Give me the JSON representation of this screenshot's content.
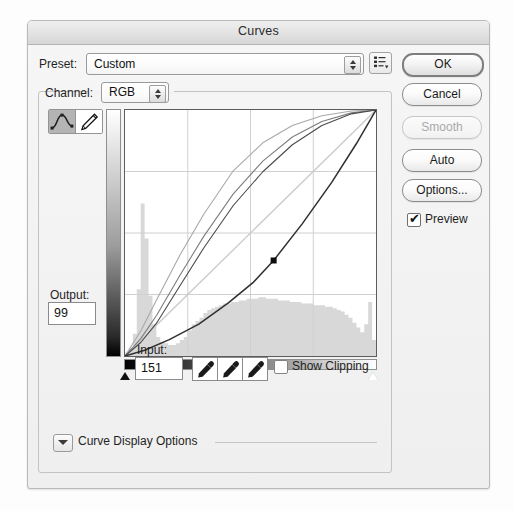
{
  "window": {
    "title": "Curves"
  },
  "preset": {
    "label": "Preset:",
    "value": "Custom",
    "menu_icon": "preset-menu-icon"
  },
  "channel": {
    "label": "Channel:",
    "value": "RGB"
  },
  "tools": {
    "curve_icon": "curve-tool-icon",
    "pencil_icon": "pencil-tool-icon"
  },
  "fields": {
    "output_label": "Output:",
    "output_value": "99",
    "input_label": "Input:",
    "input_value": "151"
  },
  "eyedroppers": {
    "black_icon": "eyedropper-black-icon",
    "gray_icon": "eyedropper-gray-icon",
    "white_icon": "eyedropper-white-icon"
  },
  "clipping": {
    "label": "Show Clipping",
    "checked": false
  },
  "curve_display_options": {
    "label": "Curve Display Options",
    "expanded": false,
    "disclosure_icon": "chevron-down-icon"
  },
  "buttons": {
    "ok": "OK",
    "cancel": "Cancel",
    "smooth": "Smooth",
    "auto": "Auto",
    "options": "Options..."
  },
  "preview": {
    "label": "Preview",
    "checked": true,
    "check_glyph": "✔"
  },
  "colors": {
    "dialog_bg": "#f1f1f1",
    "titlebar": "#e2e2e2",
    "plot_bg": "#ffffff",
    "grid_line": "#cfcfcf",
    "histogram": "#d6d6d6",
    "curve_dark": "#3a3a3a",
    "curve_mid": "#6e6e6e",
    "curve_light": "#a8a8a8",
    "baseline": "#c9c9c9",
    "control_point": "#111111"
  },
  "chart_data": {
    "type": "line",
    "xlabel": "Input",
    "ylabel": "Output",
    "xlim": [
      0,
      255
    ],
    "ylim": [
      0,
      255
    ],
    "grid": true,
    "grid_divisions": 4,
    "legend": "none",
    "control_points": [
      {
        "input": 151,
        "output": 99
      }
    ],
    "baseline": {
      "name": "identity diagonal",
      "x": [
        0,
        255
      ],
      "y": [
        0,
        255
      ]
    },
    "series": [
      {
        "name": "curve-light-upper",
        "color": "#a8a8a8",
        "x": [
          0,
          16,
          32,
          56,
          80,
          110,
          140,
          170,
          200,
          230,
          255
        ],
        "y": [
          0,
          26,
          58,
          105,
          147,
          192,
          221,
          239,
          249,
          254,
          255
        ]
      },
      {
        "name": "curve-mid-upper",
        "color": "#7d7d7d",
        "x": [
          0,
          16,
          32,
          56,
          80,
          110,
          140,
          170,
          200,
          230,
          255
        ],
        "y": [
          0,
          18,
          42,
          84,
          124,
          168,
          202,
          227,
          243,
          252,
          255
        ]
      },
      {
        "name": "curve-dark-upper",
        "color": "#4a4a4a",
        "x": [
          0,
          16,
          32,
          56,
          80,
          110,
          140,
          170,
          200,
          230,
          255
        ],
        "y": [
          0,
          14,
          34,
          73,
          112,
          156,
          191,
          219,
          239,
          251,
          255
        ]
      },
      {
        "name": "curve-active-lower",
        "color": "#2f2f2f",
        "x": [
          0,
          20,
          45,
          75,
          105,
          130,
          151,
          180,
          210,
          235,
          255
        ],
        "y": [
          0,
          6,
          17,
          33,
          55,
          76,
          99,
          137,
          180,
          220,
          255
        ]
      }
    ],
    "histogram": {
      "name": "image-histogram",
      "bins": 64,
      "values": [
        2,
        5,
        14,
        42,
        96,
        74,
        38,
        20,
        12,
        9,
        8,
        7,
        7,
        8,
        10,
        12,
        16,
        20,
        22,
        24,
        27,
        29,
        30,
        31,
        32,
        33,
        33,
        34,
        34,
        35,
        35,
        36,
        36,
        36,
        37,
        37,
        36,
        36,
        36,
        35,
        35,
        35,
        34,
        34,
        34,
        33,
        33,
        33,
        32,
        32,
        32,
        31,
        31,
        30,
        29,
        28,
        26,
        24,
        21,
        18,
        15,
        20,
        34,
        10
      ]
    },
    "gradient_bars": {
      "horizontal": {
        "from": "#000000",
        "to": "#ffffff",
        "position": "below-plot"
      },
      "vertical": {
        "from": "#ffffff",
        "to": "#000000",
        "position": "left-of-plot"
      }
    },
    "markers": [
      {
        "name": "black-point-marker",
        "position": "bottom-left",
        "color": "#111111"
      },
      {
        "name": "white-point-marker",
        "position": "bottom-right",
        "color": "#ffffff"
      }
    ]
  }
}
